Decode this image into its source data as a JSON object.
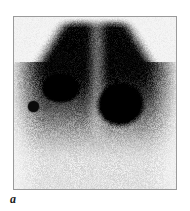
{
  "figure": {
    "panel_label": "a",
    "modality": "scintigraphy",
    "caption_position": "bottom-left",
    "background_color": "#ffffff",
    "frame": {
      "border_color": "#9a9a9a",
      "border_width_px": 1,
      "fill_color": "#f4f4f2",
      "x": 13,
      "y": 16,
      "width": 164,
      "height": 174
    }
  },
  "scan": {
    "name": "planar-radionuclide-scan",
    "colormap": "grayscale-inverted",
    "background_intensity": "#f2f2f0",
    "field_shape": "trapezoid-dome",
    "noise": "speckle",
    "uptake_field": {
      "description": "diffuse mottled tracer uptake forming an inverted-V / dome shape occupying the upper two thirds of the field, fading inferiorly",
      "top_edge_y": 0,
      "bottom_fade_y": 150,
      "left_shoulder_x": 18,
      "right_shoulder_x": 146,
      "apex_x": 82,
      "midline_cleft_x": 84,
      "midline_cleft_intensity": "lighter vertical band separating the two lobes"
    },
    "hot_spots": [
      {
        "name": "focal-uptake-left",
        "cx": 47,
        "cy": 72,
        "rx": 17,
        "ry": 13,
        "intensity": "#000000",
        "label": "left focal hot spot"
      },
      {
        "name": "focal-uptake-right",
        "cx": 107,
        "cy": 89,
        "rx": 22,
        "ry": 20,
        "intensity": "#000000",
        "label": "right focal hot spot (larger, more intense)"
      }
    ],
    "reference_markers": [
      {
        "name": "reference-marker-left",
        "cx": 19,
        "cy": 89,
        "diameter": 11,
        "color": "#0b0b0b",
        "side": "left"
      },
      {
        "name": "reference-marker-right",
        "cx": 168,
        "cy": 112,
        "diameter": 10,
        "color": "#0b0b0b",
        "side": "right"
      }
    ]
  }
}
